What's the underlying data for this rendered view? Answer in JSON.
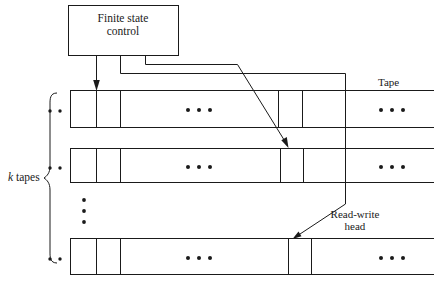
{
  "figure": {
    "title_block": {
      "line1": "Finite state",
      "line2": "control"
    },
    "labels": {
      "tape": "Tape",
      "k_tapes_k": "k",
      "k_tapes_rest": " tapes",
      "read_write_line1": "Read-write",
      "read_write_line2": "head"
    },
    "colors": {
      "stroke": "#1a1a1a",
      "background": "#ffffff",
      "text": "#1a1a1a"
    },
    "structure": {
      "tape_rows": 3,
      "ellipsis_in_tape": "• • •",
      "ellipsis_left_of_tape": "• •",
      "vertical_ellipsis": "•"
    }
  }
}
